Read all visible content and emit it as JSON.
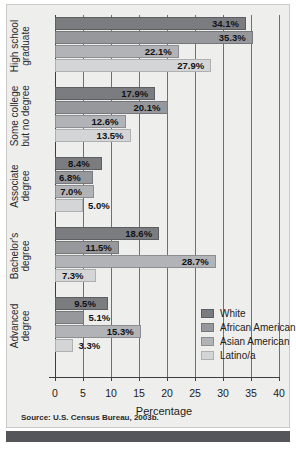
{
  "figure": {
    "source_note": "Source: U.S. Census Bureau, 2003b.",
    "colors": {
      "background": "#eeeeec",
      "footer_bar": "#55565a",
      "axis": "#3c3d40",
      "gridline": "#6f7073",
      "series": [
        "#7b7c80",
        "#97989c",
        "#b2b3b6",
        "#d4d5d6"
      ]
    }
  },
  "chart_data": {
    "type": "bar",
    "orientation": "horizontal",
    "title": "",
    "xlabel": "Percentage",
    "ylabel": "",
    "xlim": [
      0,
      40
    ],
    "xticks": [
      0,
      5,
      10,
      15,
      20,
      25,
      30,
      35,
      40
    ],
    "grid": true,
    "legend_position": "inside-lower-right",
    "categories": [
      "High school graduate",
      "Some college but no degree",
      "Associate degree",
      "Bachelor's degree",
      "Advanced degree"
    ],
    "category_lines": [
      [
        "High school",
        "graduate"
      ],
      [
        "Some college",
        "but no degree"
      ],
      [
        "Associate",
        "degree"
      ],
      [
        "Bachelor's",
        "degree"
      ],
      [
        "Advanced",
        "degree"
      ]
    ],
    "series": [
      {
        "name": "White",
        "color": "#7b7c80",
        "values": [
          34.1,
          17.9,
          8.4,
          18.6,
          9.5
        ],
        "labels": [
          "34.1%",
          "17.9%",
          "8.4%",
          "18.6%",
          "9.5%"
        ]
      },
      {
        "name": "African American",
        "color": "#97989c",
        "values": [
          35.3,
          20.1,
          6.8,
          11.5,
          5.1
        ],
        "labels": [
          "35.3%",
          "20.1%",
          "6.8%",
          "11.5%",
          "5.1%"
        ]
      },
      {
        "name": "Asian American",
        "color": "#b2b3b6",
        "values": [
          22.1,
          12.6,
          7.0,
          28.7,
          15.3
        ],
        "labels": [
          "22.1%",
          "12.6%",
          "7.0%",
          "28.7%",
          "15.3%"
        ]
      },
      {
        "name": "Latino/a",
        "color": "#d4d5d6",
        "values": [
          27.9,
          13.5,
          5.0,
          7.3,
          3.3
        ],
        "labels": [
          "27.9%",
          "13.5%",
          "5.0%",
          "7.3%",
          "3.3%"
        ]
      }
    ]
  }
}
